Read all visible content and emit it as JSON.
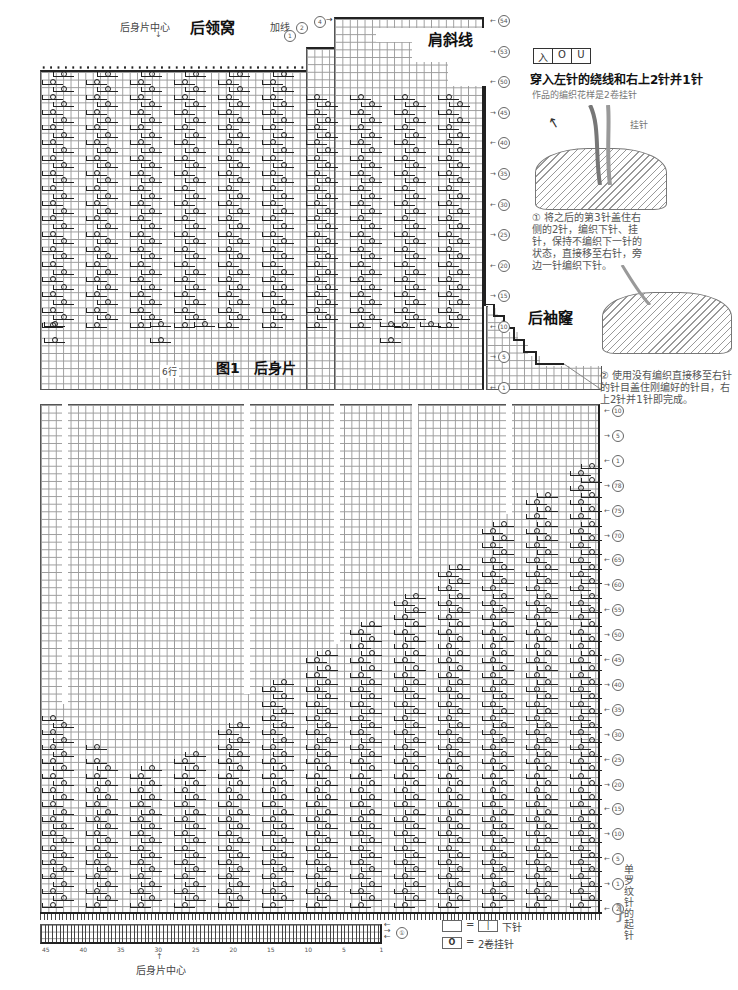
{
  "top_chart": {
    "center_label": "后身片中心",
    "neckline_title": "后领窝",
    "add_yarn_label": "加线",
    "shoulder_title": "肩斜线",
    "armhole_title": "后袖窿",
    "six_rows_label": "6行",
    "marks": [
      "①",
      "②",
      "④",
      "⑤",
      "①"
    ],
    "right_rows": [
      "54",
      "53",
      "50",
      "45",
      "40",
      "35",
      "30",
      "25",
      "20",
      "15",
      "10",
      "5",
      "1"
    ]
  },
  "figure_title": "图1　后身片",
  "bottom_chart": {
    "right_rows": [
      "10",
      "5",
      "1",
      "78",
      "75",
      "70",
      "65",
      "60",
      "55",
      "50",
      "45",
      "40",
      "35",
      "30",
      "25",
      "20",
      "15",
      "10",
      "5",
      "1",
      "2"
    ],
    "rib_label": "单罗纹针的起针",
    "rib_mark": "①",
    "x_ticks": [
      "45",
      "40",
      "35",
      "30",
      "25",
      "20",
      "15",
      "10",
      "5",
      "1"
    ],
    "center_label": "后身片中心"
  },
  "legend": {
    "items": [
      {
        "box": "",
        "equals": "=",
        "symbol": "|",
        "text": "下针"
      },
      {
        "box": "O",
        "equals": "=",
        "symbol": "",
        "text": "2卷挂针"
      }
    ]
  },
  "technique": {
    "symbol_cells": [
      "入",
      "O",
      "U"
    ],
    "title": "穿入左针的绕线和右上2针并1针",
    "subtitle": "作品的编织花样是2卷挂针",
    "yarn_over_label": "挂针",
    "step1": "① 将之后的第3针盖住右侧的2针，编织下针、挂针，保持不编织下一针的状态，直接移至右针，旁边一针编织下针。",
    "step2": "② 使用没有编织直接移至右针的针目盖住刚编好的针目，右上2针并1针即完成。"
  },
  "colors": {
    "ink": "#222222",
    "grid": "#9a9a9a",
    "text": "#444444"
  }
}
